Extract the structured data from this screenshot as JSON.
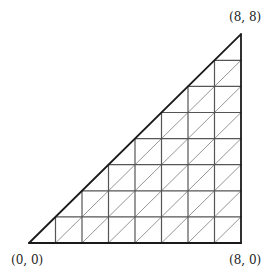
{
  "diagram": {
    "type": "triangulated-right-triangle",
    "n": 8,
    "vertices": [
      {
        "id": "origin",
        "label": "(0, 0)",
        "x": 0,
        "y": 0
      },
      {
        "id": "bottom-right",
        "label": "(8, 0)",
        "x": 8,
        "y": 0
      },
      {
        "id": "top-right",
        "label": "(8, 8)",
        "x": 8,
        "y": 8
      }
    ],
    "grid_divisions": 8,
    "diagonal_direction": "bottom-left-to-top-right",
    "colors": {
      "outline": "#1a1a1a",
      "grid": "#555555",
      "diagonal": "#8a8a8a",
      "background": "#ffffff"
    }
  },
  "pixel_map": {
    "x0": 29,
    "y0": 243,
    "sx": 26.5,
    "sy": 26.1
  }
}
